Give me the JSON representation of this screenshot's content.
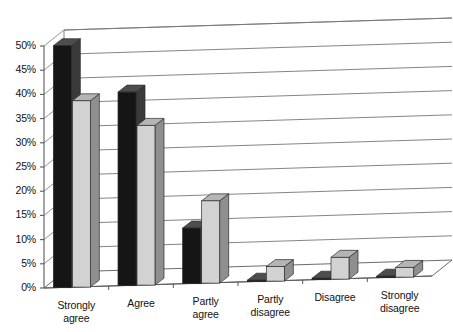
{
  "chart_data": {
    "type": "bar",
    "title": "",
    "subtitle": "",
    "xlabel": "",
    "ylabel": "",
    "ylim": [
      0,
      50
    ],
    "ytick_step": 5,
    "grid": true,
    "legend": "none",
    "three_d": true,
    "categories": [
      "Strongly\nagree",
      "Agree",
      "Partly\nagree",
      "Partly\ndisagree",
      "Disagree",
      "Strongly\ndisagree"
    ],
    "ytick_labels": [
      "0%",
      "5%",
      "10%",
      "15%",
      "20%",
      "25%",
      "30%",
      "35%",
      "40%",
      "45%",
      "50%"
    ],
    "ytick_values": [
      0,
      5,
      10,
      15,
      20,
      25,
      30,
      35,
      40,
      45,
      50
    ],
    "series": [
      {
        "name": "series-1",
        "color": "#151515",
        "side_color": "#3a3a3a",
        "top_color": "#4d4d4d",
        "values": [
          50,
          40,
          11.5,
          0.3,
          0.3,
          0.3
        ]
      },
      {
        "name": "series-2",
        "color": "#d2d2d2",
        "side_color": "#8f8f8f",
        "top_color": "#b5b5b5",
        "values": [
          38.5,
          33,
          17,
          3,
          4.5,
          2
        ]
      }
    ]
  },
  "colors": {
    "axis": "#5a5a5a",
    "grid": "#777777",
    "background": "#ffffff",
    "text": "#111111"
  }
}
